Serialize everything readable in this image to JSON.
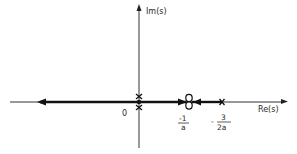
{
  "diagram": {
    "type": "root-locus",
    "axes": {
      "imag_label": "Im(s)",
      "real_label": "Re(s)"
    },
    "labels": {
      "origin": "0",
      "zero_numerator": "-1",
      "zero_denominator": "a",
      "pole_sign": "-",
      "pole_numerator": "3",
      "pole_denominator": "2a"
    },
    "poles": [
      {
        "location": "0",
        "multiplicity": 2,
        "marker": "x"
      },
      {
        "location": "-3/(2a)",
        "multiplicity": 1,
        "marker": "x"
      }
    ],
    "zeros": [
      {
        "location": "-1/a",
        "multiplicity": 2,
        "marker": "o"
      }
    ],
    "branches": [
      {
        "from": "0",
        "to": "-1/a",
        "direction": "toward zero"
      },
      {
        "from": "-3/(2a)",
        "to": "-1/a",
        "direction": "toward zero"
      },
      {
        "from": "0",
        "to": "-infinity",
        "direction": "away from origin"
      }
    ],
    "colors": {
      "ink": "#1a1a1a",
      "background": "#ffffff"
    }
  }
}
